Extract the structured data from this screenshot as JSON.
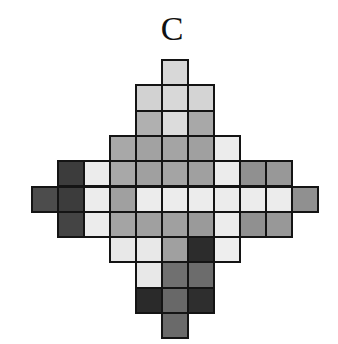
{
  "figure": {
    "label": "C"
  },
  "grid": {
    "origin_x": 32,
    "origin_y": 60,
    "cell_width": 26,
    "cell_height": 25.3,
    "columns": 11,
    "rows": 11,
    "border_color": "#141414",
    "cells": [
      {
        "row": 0,
        "col": 5,
        "color": "#d8d8d8"
      },
      {
        "row": 1,
        "col": 4,
        "color": "#d2d2d2"
      },
      {
        "row": 1,
        "col": 5,
        "color": "#d8d8d8"
      },
      {
        "row": 1,
        "col": 6,
        "color": "#d4d4d4"
      },
      {
        "row": 2,
        "col": 4,
        "color": "#b0b0b0"
      },
      {
        "row": 2,
        "col": 5,
        "color": "#dcdcdc"
      },
      {
        "row": 2,
        "col": 6,
        "color": "#a8a8a8"
      },
      {
        "row": 3,
        "col": 3,
        "color": "#a8a8a8"
      },
      {
        "row": 3,
        "col": 4,
        "color": "#a2a2a2"
      },
      {
        "row": 3,
        "col": 5,
        "color": "#a4a4a4"
      },
      {
        "row": 3,
        "col": 6,
        "color": "#a0a0a0"
      },
      {
        "row": 3,
        "col": 7,
        "color": "#ececec"
      },
      {
        "row": 4,
        "col": 1,
        "color": "#3c3c3c"
      },
      {
        "row": 4,
        "col": 2,
        "color": "#ececec"
      },
      {
        "row": 4,
        "col": 3,
        "color": "#a8a8a8"
      },
      {
        "row": 4,
        "col": 4,
        "color": "#a0a0a0"
      },
      {
        "row": 4,
        "col": 5,
        "color": "#a4a4a4"
      },
      {
        "row": 4,
        "col": 6,
        "color": "#a0a0a0"
      },
      {
        "row": 4,
        "col": 7,
        "color": "#ececec"
      },
      {
        "row": 4,
        "col": 8,
        "color": "#909090"
      },
      {
        "row": 4,
        "col": 9,
        "color": "#989898"
      },
      {
        "row": 5,
        "col": 0,
        "color": "#4c4c4c"
      },
      {
        "row": 5,
        "col": 1,
        "color": "#3c3c3c"
      },
      {
        "row": 5,
        "col": 2,
        "color": "#ececec"
      },
      {
        "row": 5,
        "col": 3,
        "color": "#a0a0a0"
      },
      {
        "row": 5,
        "col": 4,
        "color": "#ececec"
      },
      {
        "row": 5,
        "col": 5,
        "color": "#ececec"
      },
      {
        "row": 5,
        "col": 6,
        "color": "#ececec"
      },
      {
        "row": 5,
        "col": 7,
        "color": "#ececec"
      },
      {
        "row": 5,
        "col": 8,
        "color": "#ececec"
      },
      {
        "row": 5,
        "col": 9,
        "color": "#ececec"
      },
      {
        "row": 5,
        "col": 10,
        "color": "#909090"
      },
      {
        "row": 6,
        "col": 1,
        "color": "#444444"
      },
      {
        "row": 6,
        "col": 2,
        "color": "#ececec"
      },
      {
        "row": 6,
        "col": 3,
        "color": "#a4a4a4"
      },
      {
        "row": 6,
        "col": 4,
        "color": "#a0a0a0"
      },
      {
        "row": 6,
        "col": 5,
        "color": "#a0a0a0"
      },
      {
        "row": 6,
        "col": 6,
        "color": "#9a9a9a"
      },
      {
        "row": 6,
        "col": 7,
        "color": "#ececec"
      },
      {
        "row": 6,
        "col": 8,
        "color": "#909090"
      },
      {
        "row": 6,
        "col": 9,
        "color": "#989898"
      },
      {
        "row": 7,
        "col": 3,
        "color": "#e8e8e8"
      },
      {
        "row": 7,
        "col": 4,
        "color": "#e8e8e8"
      },
      {
        "row": 7,
        "col": 5,
        "color": "#a0a0a0"
      },
      {
        "row": 7,
        "col": 6,
        "color": "#2c2c2c"
      },
      {
        "row": 7,
        "col": 7,
        "color": "#eeeeee"
      },
      {
        "row": 8,
        "col": 4,
        "color": "#e8e8e8"
      },
      {
        "row": 8,
        "col": 5,
        "color": "#707070"
      },
      {
        "row": 8,
        "col": 6,
        "color": "#6c6c6c"
      },
      {
        "row": 9,
        "col": 4,
        "color": "#2a2a2a"
      },
      {
        "row": 9,
        "col": 5,
        "color": "#686868"
      },
      {
        "row": 9,
        "col": 6,
        "color": "#2e2e2e"
      },
      {
        "row": 10,
        "col": 5,
        "color": "#6a6a6a"
      }
    ]
  }
}
